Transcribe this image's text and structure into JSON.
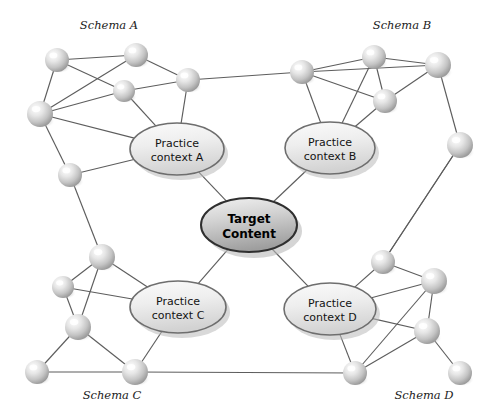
{
  "diagram": {
    "type": "node-link-network",
    "background_color": "#ffffff",
    "edge_color": "#5d5d5d",
    "node_fill_light": "#fdfdfd",
    "node_fill_mid": "#d8d8d8",
    "node_fill_dark": "#9a9a9a",
    "ellipse_fill_light": "#f2f2f2",
    "ellipse_fill_dark": "#c9c9c9",
    "ellipse_stroke": "#6e6e6e",
    "center_fill_light": "#eaeaea",
    "center_fill_dark": "#9d9d9d",
    "center_stroke": "#2f2f2f",
    "shadow_color": "#b9b9b9"
  },
  "labels": {
    "schema_a": "Schema A",
    "schema_b": "Schema B",
    "schema_c": "Schema C",
    "schema_d": "Schema D"
  },
  "label_positions": {
    "schema_a": {
      "x": 109,
      "y": 29
    },
    "schema_b": {
      "x": 402,
      "y": 29
    },
    "schema_c": {
      "x": 112,
      "y": 399
    },
    "schema_d": {
      "x": 424,
      "y": 399
    }
  },
  "center_node": {
    "name": "target-content",
    "line1": "Target",
    "line2": "Content",
    "cx": 249,
    "cy": 225,
    "rx": 48,
    "ry": 27
  },
  "practice_contexts": [
    {
      "id": "practice-context-a",
      "line1": "Practice",
      "line2": "context A",
      "cx": 177,
      "cy": 149,
      "rx": 47,
      "ry": 26
    },
    {
      "id": "practice-context-b",
      "line1": "Practice",
      "line2": "context B",
      "cx": 330,
      "cy": 148,
      "rx": 45,
      "ry": 26
    },
    {
      "id": "practice-context-c",
      "line1": "Practice",
      "line2": "context C",
      "cx": 178,
      "cy": 307,
      "rx": 48,
      "ry": 26
    },
    {
      "id": "practice-context-d",
      "line1": "Practice",
      "line2": "context D",
      "cx": 330,
      "cy": 309,
      "rx": 46,
      "ry": 26
    }
  ],
  "nodes": [
    {
      "id": "a1",
      "schema": "A",
      "cx": 57,
      "cy": 60,
      "r": 12
    },
    {
      "id": "a2",
      "schema": "A",
      "cx": 136,
      "cy": 55,
      "r": 12
    },
    {
      "id": "a3",
      "schema": "A",
      "cx": 40,
      "cy": 114,
      "r": 13
    },
    {
      "id": "a4",
      "schema": "A",
      "cx": 124,
      "cy": 91,
      "r": 11
    },
    {
      "id": "a5",
      "schema": "A",
      "cx": 188,
      "cy": 80,
      "r": 12
    },
    {
      "id": "a6",
      "schema": "A",
      "cx": 70,
      "cy": 175,
      "r": 12
    },
    {
      "id": "b1",
      "schema": "B",
      "cx": 302,
      "cy": 72,
      "r": 12
    },
    {
      "id": "b2",
      "schema": "B",
      "cx": 374,
      "cy": 57,
      "r": 12
    },
    {
      "id": "b3",
      "schema": "B",
      "cx": 438,
      "cy": 65,
      "r": 13
    },
    {
      "id": "b4",
      "schema": "B",
      "cx": 385,
      "cy": 101,
      "r": 12
    },
    {
      "id": "b5",
      "schema": "B",
      "cx": 460,
      "cy": 145,
      "r": 13
    },
    {
      "id": "c1",
      "schema": "C",
      "cx": 102,
      "cy": 257,
      "r": 13
    },
    {
      "id": "c2",
      "schema": "C",
      "cx": 63,
      "cy": 287,
      "r": 11
    },
    {
      "id": "c3",
      "schema": "C",
      "cx": 78,
      "cy": 327,
      "r": 13
    },
    {
      "id": "c4",
      "schema": "C",
      "cx": 37,
      "cy": 372,
      "r": 12
    },
    {
      "id": "c5",
      "schema": "C",
      "cx": 135,
      "cy": 372,
      "r": 13
    },
    {
      "id": "d1",
      "schema": "D",
      "cx": 383,
      "cy": 262,
      "r": 12
    },
    {
      "id": "d2",
      "schema": "D",
      "cx": 434,
      "cy": 281,
      "r": 13
    },
    {
      "id": "d3",
      "schema": "D",
      "cx": 427,
      "cy": 331,
      "r": 13
    },
    {
      "id": "d4",
      "schema": "D",
      "cx": 460,
      "cy": 373,
      "r": 12
    },
    {
      "id": "d5",
      "schema": "D",
      "cx": 355,
      "cy": 373,
      "r": 12
    }
  ],
  "edges": [
    {
      "from": "a1",
      "to": "a2"
    },
    {
      "from": "a1",
      "to": "a3"
    },
    {
      "from": "a1",
      "to": "a4"
    },
    {
      "from": "a2",
      "to": "a3"
    },
    {
      "from": "a2",
      "to": "a5"
    },
    {
      "from": "a3",
      "to": "a4"
    },
    {
      "from": "a3",
      "to": "a6"
    },
    {
      "from": "a4",
      "to": "a5"
    },
    {
      "from": "a5",
      "to": "b1"
    },
    {
      "from": "b1",
      "to": "b2"
    },
    {
      "from": "b1",
      "to": "b3"
    },
    {
      "from": "b1",
      "to": "b4"
    },
    {
      "from": "b2",
      "to": "b3"
    },
    {
      "from": "b2",
      "to": "b4"
    },
    {
      "from": "b3",
      "to": "b4"
    },
    {
      "from": "b3",
      "to": "b5"
    },
    {
      "from": "b5",
      "to": "d1"
    },
    {
      "from": "c1",
      "to": "c2"
    },
    {
      "from": "c1",
      "to": "c3"
    },
    {
      "from": "c2",
      "to": "c3"
    },
    {
      "from": "c3",
      "to": "c4"
    },
    {
      "from": "c3",
      "to": "c5"
    },
    {
      "from": "c4",
      "to": "c5"
    },
    {
      "from": "c5",
      "to": "d5"
    },
    {
      "from": "d1",
      "to": "d2"
    },
    {
      "from": "d2",
      "to": "d3"
    },
    {
      "from": "d2",
      "to": "d5"
    },
    {
      "from": "d3",
      "to": "d4"
    },
    {
      "from": "d3",
      "to": "d5"
    },
    {
      "from": "a6",
      "to": "c1"
    },
    {
      "from": "d1",
      "to": "b5"
    }
  ],
  "node_ellipse_edges": [
    {
      "node": "a4",
      "ellipse": "practice-context-a"
    },
    {
      "node": "a5",
      "ellipse": "practice-context-a"
    },
    {
      "node": "a3",
      "ellipse": "practice-context-a"
    },
    {
      "node": "a6",
      "ellipse": "practice-context-a"
    },
    {
      "node": "b1",
      "ellipse": "practice-context-b"
    },
    {
      "node": "b2",
      "ellipse": "practice-context-b"
    },
    {
      "node": "b4",
      "ellipse": "practice-context-b"
    },
    {
      "node": "c1",
      "ellipse": "practice-context-c"
    },
    {
      "node": "c2",
      "ellipse": "practice-context-c"
    },
    {
      "node": "c5",
      "ellipse": "practice-context-c"
    },
    {
      "node": "d1",
      "ellipse": "practice-context-d"
    },
    {
      "node": "d2",
      "ellipse": "practice-context-d"
    },
    {
      "node": "d3",
      "ellipse": "practice-context-d"
    },
    {
      "node": "d5",
      "ellipse": "practice-context-d"
    }
  ],
  "center_edges": [
    {
      "ellipse": "practice-context-a"
    },
    {
      "ellipse": "practice-context-b"
    },
    {
      "ellipse": "practice-context-c"
    },
    {
      "ellipse": "practice-context-d"
    }
  ]
}
